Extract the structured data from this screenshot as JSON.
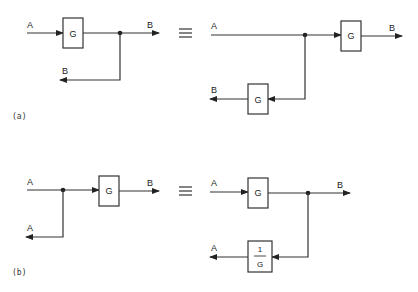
{
  "diagram": {
    "type": "block-diagram-equivalences",
    "equivalence_symbol": "≡",
    "panels": [
      {
        "id": "a",
        "caption": "(a)",
        "left": {
          "input": "A",
          "block": "G",
          "output": "B",
          "takeoff_output": "B",
          "description": "Takeoff point after block G"
        },
        "right": {
          "input": "A",
          "block_forward": "G",
          "block_takeoff": "G",
          "output": "B",
          "takeoff_output": "B",
          "description": "Takeoff point moved before block G, with G inserted in takeoff branch"
        }
      },
      {
        "id": "b",
        "caption": "(b)",
        "left": {
          "input": "A",
          "block": "G",
          "output": "B",
          "takeoff_output": "A",
          "description": "Takeoff point before block G"
        },
        "right": {
          "input": "A",
          "block_forward": "G",
          "block_takeoff_num": "1",
          "block_takeoff_den": "G",
          "output": "B",
          "takeoff_output": "A",
          "description": "Takeoff point moved after block G, with 1/G inserted in takeoff branch"
        }
      }
    ]
  }
}
